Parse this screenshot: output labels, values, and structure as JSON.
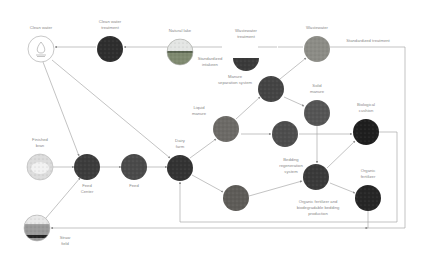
{
  "diagram": {
    "colors": {
      "line": "#9a9a9a",
      "text": "#8a8a8a",
      "background": "#ffffff"
    },
    "nodes": [
      {
        "id": "clean_water",
        "label_lines": [
          "Clean water"
        ],
        "x": 41,
        "y": 49,
        "r": 13,
        "style": "outline",
        "icon": "water-drop-icon"
      },
      {
        "id": "clean_water_treatment",
        "label_lines": [
          "Clean water",
          "treatment"
        ],
        "x": 110,
        "y": 49,
        "r": 13,
        "style": "photo",
        "fill": "#2e2e2e"
      },
      {
        "id": "natural_lake",
        "label_lines": [
          "Natural lake"
        ],
        "x": 180,
        "y": 52,
        "r": 13,
        "style": "photo-lake",
        "fill": "#7f8a70"
      },
      {
        "id": "wastewater_treatment",
        "label_lines": [
          "Wastewater",
          "treatment"
        ],
        "x": 246,
        "y": 58,
        "r": 13,
        "style": "half",
        "fill": "#3a3a3a"
      },
      {
        "id": "wastewater",
        "label_lines": [
          "Wastewater"
        ],
        "x": 317,
        "y": 49,
        "r": 13,
        "style": "photo",
        "fill": "#8c8c86"
      },
      {
        "id": "manure_separation",
        "label_lines": [
          "Manure",
          "separation system"
        ],
        "x": 271,
        "y": 89,
        "r": 13,
        "style": "photo",
        "fill": "#444"
      },
      {
        "id": "solid_manure",
        "label_lines": [
          "Solid",
          "manure"
        ],
        "x": 317,
        "y": 113,
        "r": 13,
        "style": "photo",
        "fill": "#555"
      },
      {
        "id": "liquid_manure",
        "label_lines": [
          "Liquid",
          "manure"
        ],
        "x": 226,
        "y": 129,
        "r": 13,
        "style": "photo",
        "fill": "#6c6a66"
      },
      {
        "id": "bedding_recycle",
        "label_lines": [],
        "x": 285,
        "y": 134,
        "r": 13,
        "style": "photo",
        "fill": "#4d4d4d"
      },
      {
        "id": "biological_cushion",
        "label_lines": [
          "Biological",
          "cushion"
        ],
        "x": 366,
        "y": 132,
        "r": 13,
        "style": "photo",
        "fill": "#1e1e1e"
      },
      {
        "id": "finished_bran",
        "label_lines": [
          "Finished",
          "bran"
        ],
        "x": 40,
        "y": 167,
        "r": 13,
        "style": "outline-photo",
        "fill": "#dcdcdc"
      },
      {
        "id": "feed_center",
        "label_lines": [
          "Feed",
          "Center"
        ],
        "x": 87,
        "y": 167,
        "r": 13,
        "style": "photo",
        "fill": "#3c3c3c"
      },
      {
        "id": "feed",
        "label_lines": [
          "Feed"
        ],
        "x": 134,
        "y": 167,
        "r": 13,
        "style": "photo",
        "fill": "#4a4a4a"
      },
      {
        "id": "dairy_farm",
        "label_lines": [
          "Dairy",
          "farm"
        ],
        "x": 180,
        "y": 168,
        "r": 13,
        "style": "photo",
        "fill": "#333"
      },
      {
        "id": "bedding_regeneration",
        "label_lines": [
          "Bedding",
          "regeneration",
          "system"
        ],
        "x": 316,
        "y": 177,
        "r": 13,
        "style": "photo",
        "fill": "#3a3a3a"
      },
      {
        "id": "compost",
        "label_lines": [],
        "x": 236,
        "y": 198,
        "r": 13,
        "style": "photo",
        "fill": "#5e5c58"
      },
      {
        "id": "organic_fertilizer",
        "label_lines": [
          "Organic",
          "fertilizer"
        ],
        "x": 368,
        "y": 198,
        "r": 13,
        "style": "photo",
        "fill": "#262626"
      },
      {
        "id": "straw_field",
        "label_lines": [
          "Straw",
          "field"
        ],
        "x": 37,
        "y": 228,
        "r": 13,
        "style": "photo-field",
        "fill": "#9a9a9a"
      }
    ],
    "free_labels": [
      {
        "id": "standardized_intake",
        "lines": [
          "Standardized",
          "intakeen"
        ],
        "x": 210,
        "y": 56
      },
      {
        "id": "standardized_treatment",
        "lines": [
          "Standardized treatment"
        ],
        "x": 368,
        "y": 38
      },
      {
        "id": "bedding_production",
        "lines": [
          "Organic fertilizer and",
          "biodegradable bedding",
          "production"
        ],
        "x": 318,
        "y": 199
      }
    ],
    "edges": [
      {
        "from": "natural_lake",
        "to": "clean_water_treatment",
        "points": [
          [
            222,
            47
          ],
          [
            166,
            47
          ],
          [
            124,
            47
          ]
        ],
        "arrow": true
      },
      {
        "from": "clean_water_treatment",
        "to": "clean_water",
        "points": [
          [
            96,
            47
          ],
          [
            55,
            47
          ]
        ],
        "arrow": true
      },
      {
        "from": "wastewater_treatment",
        "to": "natural_lake",
        "points": [
          [
            258,
            47
          ],
          [
            277,
            47
          ]
        ],
        "arrow": false
      },
      {
        "from": "wastewater",
        "to": "wastewater_treatment",
        "points": [
          [
            303,
            47
          ],
          [
            278,
            47
          ]
        ],
        "arrow": false
      },
      {
        "from": "wastewater",
        "to": "right_rail",
        "points": [
          [
            330,
            47
          ],
          [
            405,
            47
          ],
          [
            405,
            228
          ],
          [
            365,
            228
          ]
        ],
        "arrow": true
      },
      {
        "from": "clean_water",
        "to": "feed_center",
        "points": [
          [
            43,
            62
          ],
          [
            79,
            156
          ]
        ],
        "arrow": true
      },
      {
        "from": "clean_water",
        "to": "dairy_farm",
        "points": [
          [
            52,
            60
          ],
          [
            170,
            158
          ]
        ],
        "arrow": true
      },
      {
        "from": "finished_bran",
        "to": "feed_center",
        "points": [
          [
            53,
            167
          ],
          [
            74,
            167
          ]
        ],
        "arrow": true
      },
      {
        "from": "feed_center",
        "to": "feed",
        "points": [
          [
            100,
            167
          ],
          [
            121,
            167
          ]
        ],
        "arrow": true
      },
      {
        "from": "feed",
        "to": "dairy_farm",
        "points": [
          [
            147,
            167
          ],
          [
            167,
            167
          ]
        ],
        "arrow": true
      },
      {
        "from": "straw_field",
        "to": "feed_center",
        "points": [
          [
            46,
            218
          ],
          [
            80,
            178
          ]
        ],
        "arrow": true
      },
      {
        "from": "dairy_farm",
        "to": "liquid_manure",
        "points": [
          [
            190,
            158
          ],
          [
            216,
            139
          ]
        ],
        "arrow": true
      },
      {
        "from": "liquid_manure",
        "to": "manure_separation",
        "points": [
          [
            236,
            119
          ],
          [
            260,
            97
          ]
        ],
        "arrow": true
      },
      {
        "from": "manure_separation",
        "to": "wastewater",
        "points": [
          [
            280,
            79
          ],
          [
            306,
            58
          ]
        ],
        "arrow": true
      },
      {
        "from": "manure_separation",
        "to": "solid_manure",
        "points": [
          [
            284,
            97
          ],
          [
            304,
            106
          ]
        ],
        "arrow": true
      },
      {
        "from": "liquid_manure",
        "to": "bedding_recycle",
        "points": [
          [
            241,
            134
          ],
          [
            271,
            134
          ]
        ],
        "arrow": true
      },
      {
        "from": "bedding_recycle",
        "to": "biological_cushion",
        "points": [
          [
            299,
            134
          ],
          [
            352,
            134
          ]
        ],
        "arrow": true
      },
      {
        "from": "solid_manure",
        "to": "bedding_regeneration",
        "points": [
          [
            317,
            126
          ],
          [
            317,
            163
          ]
        ],
        "arrow": true
      },
      {
        "from": "dairy_farm",
        "to": "compost",
        "points": [
          [
            192,
            175
          ],
          [
            223,
            192
          ]
        ],
        "arrow": true
      },
      {
        "from": "compost",
        "to": "bedding_regeneration",
        "points": [
          [
            249,
            196
          ],
          [
            302,
            181
          ]
        ],
        "arrow": true
      },
      {
        "from": "bedding_regeneration",
        "to": "biological_cushion",
        "points": [
          [
            327,
            168
          ],
          [
            355,
            141
          ]
        ],
        "arrow": true
      },
      {
        "from": "bedding_regeneration",
        "to": "organic_fertilizer",
        "points": [
          [
            330,
            183
          ],
          [
            355,
            193
          ]
        ],
        "arrow": true
      },
      {
        "from": "biological_cushion",
        "to": "dairy_farm",
        "points": [
          [
            379,
            132
          ],
          [
            397,
            132
          ],
          [
            397,
            222
          ],
          [
            180,
            222
          ],
          [
            180,
            182
          ]
        ],
        "arrow": true
      },
      {
        "from": "organic_fertilizer",
        "to": "straw_field",
        "points": [
          [
            368,
            211
          ],
          [
            368,
            228
          ],
          [
            51,
            228
          ]
        ],
        "arrow": true
      }
    ]
  }
}
